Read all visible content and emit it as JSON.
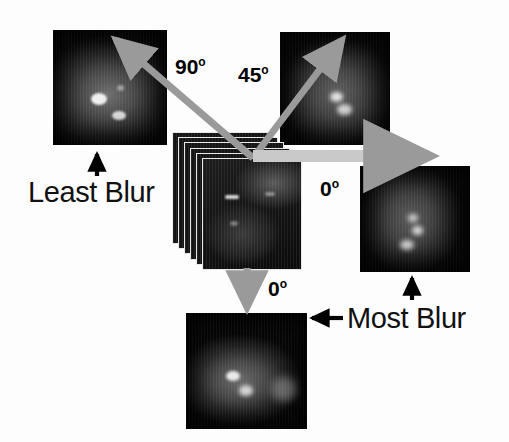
{
  "figure": {
    "background_color": "#fdfdfd",
    "arrow_gray": "#9a9a9a",
    "arrow_black": "#000000",
    "text_color": "#111111"
  },
  "angle_labels": [
    {
      "id": "ninety",
      "text": "90",
      "degree": "o",
      "x": 175,
      "y": 56
    },
    {
      "id": "forty-five",
      "text": "45",
      "degree": "o",
      "x": 238,
      "y": 64
    },
    {
      "id": "zero-right",
      "text": "0",
      "degree": "o",
      "x": 320,
      "y": 178
    },
    {
      "id": "zero-bottom",
      "text": "0",
      "degree": "o",
      "x": 268,
      "y": 278
    }
  ],
  "blur_labels": [
    {
      "id": "least",
      "text": "Least Blur",
      "x": 28,
      "y": 178
    },
    {
      "id": "most",
      "text": "Most Blur",
      "x": 347,
      "y": 304
    }
  ],
  "panels": [
    {
      "id": "top-left",
      "name": "mri-least-blur-90deg",
      "x": 53,
      "y": 30,
      "w": 114,
      "h": 115
    },
    {
      "id": "top-right",
      "name": "mri-blur-45deg",
      "x": 280,
      "y": 32,
      "w": 110,
      "h": 113
    },
    {
      "id": "right",
      "name": "mri-most-blur-0deg",
      "x": 360,
      "y": 166,
      "w": 110,
      "h": 106
    },
    {
      "id": "bottom",
      "name": "mri-blur-0deg-vert",
      "x": 186,
      "y": 313,
      "w": 121,
      "h": 116
    }
  ],
  "stack": {
    "name": "mri-slice-stack",
    "layers": 6,
    "origin_x": 172,
    "origin_y": 132,
    "offset_x": 6,
    "offset_y": 5.2,
    "slice_width": 100,
    "slice_height": 112
  },
  "arrows": {
    "gray": [
      {
        "id": "arrow-90",
        "name": "blur-arrow-90deg",
        "x1": 253,
        "y1": 158,
        "x2": 114,
        "y2": 38
      },
      {
        "id": "arrow-45",
        "name": "blur-arrow-45deg",
        "x1": 253,
        "y1": 158,
        "x2": 344,
        "y2": 38
      },
      {
        "id": "arrow-0-right",
        "name": "blur-arrow-0deg-horizontal",
        "x1": 253,
        "y1": 156,
        "x2": 434,
        "y2": 156
      },
      {
        "id": "arrow-0-down",
        "name": "blur-arrow-0deg-vertical",
        "x1": 247,
        "y1": 268,
        "x2": 247,
        "y2": 314
      }
    ],
    "black": [
      {
        "id": "pointer-least",
        "name": "least-blur-pointer",
        "x1": 97,
        "y1": 175,
        "x2": 97,
        "y2": 151
      },
      {
        "id": "pointer-most",
        "name": "most-blur-pointer",
        "x1": 343,
        "y1": 318,
        "x2": 310,
        "y2": 318
      },
      {
        "id": "pointer-right",
        "name": "most-blur-up-pointer",
        "x1": 412,
        "y1": 300,
        "x2": 412,
        "y2": 276
      }
    ]
  }
}
